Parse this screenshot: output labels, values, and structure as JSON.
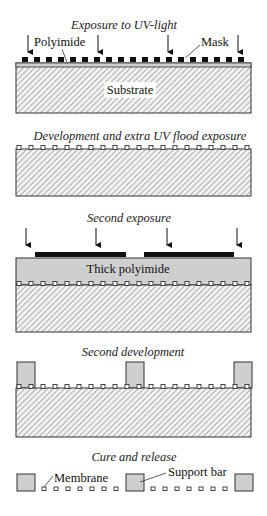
{
  "figure": {
    "steps": [
      {
        "title": "Exposure to UV-light",
        "labels": {
          "polyimide": "Polyimide",
          "mask": "Mask",
          "substrate": "Substrate"
        }
      },
      {
        "title": "Development and extra UV flood exposure"
      },
      {
        "title": "Second exposure",
        "labels": {
          "thick_polyimide": "Thick  polyimide"
        }
      },
      {
        "title": "Second development"
      },
      {
        "title": "Cure and release",
        "labels": {
          "membrane": "Membrane",
          "support_bar": "Support bar"
        }
      }
    ],
    "colors": {
      "mask": "#111111",
      "polyimide": "#cfcfcf",
      "substrate_hatch": "#8a8a8a",
      "outline": "#333333"
    }
  }
}
